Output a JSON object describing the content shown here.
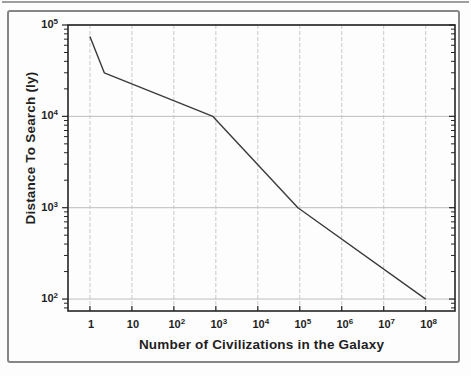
{
  "figure": {
    "background": "#fdfdfd",
    "frame_color": "#868686",
    "scan_band_color": "#9e9e9e"
  },
  "chart_data": {
    "type": "line",
    "title": "",
    "xlabel": "Number of Civilizations in the Galaxy",
    "ylabel": "Distance To Search (ly)",
    "x_scale": "log",
    "y_scale": "log",
    "xlim": [
      0.3,
      500000000
    ],
    "ylim": [
      74,
      100000
    ],
    "grid": true,
    "legend": false,
    "x_ticks": [
      {
        "value": 1,
        "base": "1",
        "exp": ""
      },
      {
        "value": 10,
        "base": "10",
        "exp": ""
      },
      {
        "value": 100,
        "base": "10",
        "exp": "2"
      },
      {
        "value": 1000,
        "base": "10",
        "exp": "3"
      },
      {
        "value": 10000,
        "base": "10",
        "exp": "4"
      },
      {
        "value": 100000,
        "base": "10",
        "exp": "5"
      },
      {
        "value": 1000000,
        "base": "10",
        "exp": "6"
      },
      {
        "value": 10000000,
        "base": "10",
        "exp": "7"
      },
      {
        "value": 100000000,
        "base": "10",
        "exp": "8"
      }
    ],
    "y_ticks": [
      {
        "value": 100,
        "base": "10",
        "exp": "2"
      },
      {
        "value": 1000,
        "base": "10",
        "exp": "3"
      },
      {
        "value": 10000,
        "base": "10",
        "exp": "4"
      },
      {
        "value": 100000,
        "base": "10",
        "exp": "5"
      }
    ],
    "series": [
      {
        "name": "search-distance",
        "x": [
          1,
          2.2,
          850,
          90000,
          100000000
        ],
        "y": [
          75000,
          30000,
          10000,
          1000,
          100
        ]
      }
    ],
    "colors": {
      "line": "#3a3a3a",
      "grid_vertical": "#c9c9c9",
      "grid_horizontal": "#bdbdbd",
      "axis": "#252525",
      "text": "#1f1f1f"
    }
  }
}
